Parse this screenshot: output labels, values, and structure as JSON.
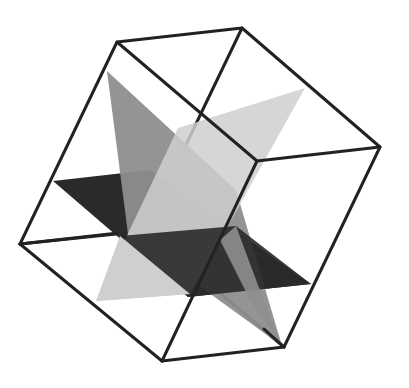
{
  "figure": {
    "colors": {
      "background": "#ffffff",
      "edge": "#222222",
      "plane_dark": "#2a2a2a",
      "plane_mid": "#8e8e8e",
      "plane_light": "#cfcfcf"
    },
    "cube_vertices": {
      "A": [
        117,
        42
      ],
      "B": [
        242,
        28
      ],
      "C": [
        380,
        147
      ],
      "D": [
        257,
        161
      ],
      "E": [
        20,
        244
      ],
      "F": [
        162,
        361
      ],
      "G": [
        284,
        347
      ],
      "H": [
        145,
        230
      ]
    },
    "planes": [
      {
        "name": "horizontal-dark-plane",
        "points": "53,181 150,170 311,284 188,297",
        "color": "#2a2a2a"
      },
      {
        "name": "diagonal-mid-plane",
        "points": "107,71 236,190 282,346 128,234",
        "color": "#8e8e8e"
      },
      {
        "name": "diagonal-light-plane",
        "points": "305,88 178,128 96,301 190,294",
        "color": "#cfcfcf"
      }
    ]
  }
}
